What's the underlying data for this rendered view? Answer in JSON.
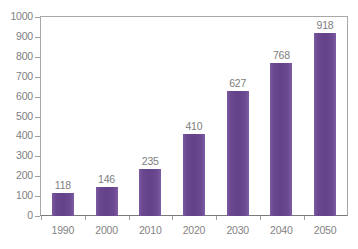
{
  "chart_data": {
    "type": "bar",
    "title": "",
    "subtitle": "",
    "xlabel": "",
    "ylabel": "",
    "categories": [
      "1990",
      "2000",
      "2010",
      "2020",
      "2030",
      "2040",
      "2050"
    ],
    "values": [
      118,
      146,
      235,
      410,
      627,
      768,
      918
    ],
    "value_labels": [
      "118",
      "146",
      "235",
      "410",
      "627",
      "768",
      "918"
    ],
    "ylim": [
      0,
      1000
    ],
    "ytick_values": [
      0,
      100,
      200,
      300,
      400,
      500,
      600,
      700,
      800,
      900,
      1000
    ],
    "ytick_labels": [
      "0",
      "100",
      "200",
      "300",
      "400",
      "500",
      "600",
      "700",
      "800",
      "900",
      "1000"
    ],
    "grid": false,
    "legend": false,
    "legend_position": "none",
    "bar_color": "#6a4790",
    "axis_color": "#a8a8a8",
    "label_color": "#808080",
    "background_color": "#ffffff",
    "orientation": "vertical",
    "annotations": []
  }
}
